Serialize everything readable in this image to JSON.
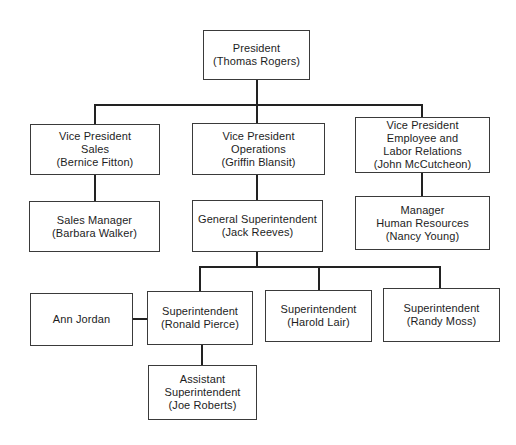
{
  "diagram": {
    "type": "org-chart",
    "colors": {
      "background": "#ffffff",
      "line": "#222222",
      "box_border": "#3a3a3a",
      "text": "#1d1d1d"
    },
    "nodes": [
      {
        "id": "president",
        "role": "President",
        "person": "Thomas Rogers",
        "lines": [
          "President",
          "(Thomas Rogers)"
        ]
      },
      {
        "id": "vp-sales",
        "role": "Vice President Sales",
        "person": "Bernice Fitton",
        "lines": [
          "Vice President",
          "Sales",
          "(Bernice Fitton)"
        ]
      },
      {
        "id": "vp-operations",
        "role": "Vice President Operations",
        "person": "Griffin Blansit",
        "lines": [
          "Vice President",
          "Operations",
          "(Griffin Blansit)"
        ]
      },
      {
        "id": "vp-employee-labor-relations",
        "role": "Vice President Employee and Labor Relations",
        "person": "John McCutcheon",
        "lines": [
          "Vice President",
          "Employee and",
          "Labor Relations",
          "(John McCutcheon)"
        ]
      },
      {
        "id": "sales-manager",
        "role": "Sales Manager",
        "person": "Barbara Walker",
        "lines": [
          "Sales Manager",
          "(Barbara Walker)"
        ]
      },
      {
        "id": "general-superintendent",
        "role": "General Superintendent",
        "person": "Jack Reeves",
        "lines": [
          "General Superintendent",
          "(Jack Reeves)"
        ]
      },
      {
        "id": "manager-human-resources",
        "role": "Manager Human Resources",
        "person": "Nancy Young",
        "lines": [
          "Manager",
          "Human Resources",
          "(Nancy Young)"
        ]
      },
      {
        "id": "ann-jordan",
        "role": "",
        "person": "Ann Jordan",
        "lines": [
          "Ann Jordan"
        ]
      },
      {
        "id": "superintendent-pierce",
        "role": "Superintendent",
        "person": "Ronald Pierce",
        "lines": [
          "Superintendent",
          "(Ronald Pierce)"
        ]
      },
      {
        "id": "superintendent-lair",
        "role": "Superintendent",
        "person": "Harold Lair",
        "lines": [
          "Superintendent",
          "(Harold Lair)"
        ]
      },
      {
        "id": "superintendent-moss",
        "role": "Superintendent",
        "person": "Randy Moss",
        "lines": [
          "Superintendent",
          "(Randy Moss)"
        ]
      },
      {
        "id": "assistant-superintendent",
        "role": "Assistant Superintendent",
        "person": "Joe Roberts",
        "lines": [
          "Assistant",
          "Superintendent",
          "(Joe Roberts)"
        ]
      }
    ],
    "edges": [
      {
        "from": "president",
        "to": "vp-sales"
      },
      {
        "from": "president",
        "to": "vp-operations"
      },
      {
        "from": "president",
        "to": "vp-employee-labor-relations"
      },
      {
        "from": "vp-sales",
        "to": "sales-manager"
      },
      {
        "from": "vp-operations",
        "to": "general-superintendent"
      },
      {
        "from": "vp-employee-labor-relations",
        "to": "manager-human-resources"
      },
      {
        "from": "general-superintendent",
        "to": "superintendent-pierce"
      },
      {
        "from": "general-superintendent",
        "to": "superintendent-lair"
      },
      {
        "from": "general-superintendent",
        "to": "superintendent-moss"
      },
      {
        "from": "ann-jordan",
        "to": "superintendent-pierce",
        "style": "lateral"
      },
      {
        "from": "superintendent-pierce",
        "to": "assistant-superintendent"
      }
    ]
  }
}
